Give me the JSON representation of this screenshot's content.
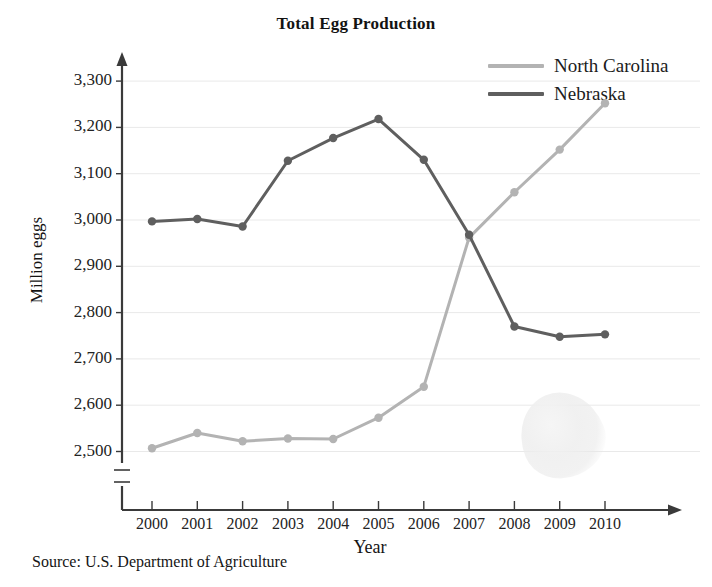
{
  "chart_data": {
    "type": "line",
    "title": "Total Egg Production",
    "xlabel": "Year",
    "ylabel": "Million eggs",
    "source": "Source: U.S. Department of Agriculture",
    "categories": [
      "2000",
      "2001",
      "2002",
      "2003",
      "2004",
      "2005",
      "2006",
      "2007",
      "2008",
      "2009",
      "2010"
    ],
    "ylim": [
      2500,
      3300
    ],
    "yticks": [
      "2,500",
      "2,600",
      "2,700",
      "2,800",
      "2,900",
      "3,000",
      "3,100",
      "3,200",
      "3,300"
    ],
    "ytick_values": [
      2500,
      2600,
      2700,
      2800,
      2900,
      3000,
      3100,
      3200,
      3300
    ],
    "grid": true,
    "axis_break": true,
    "legend_position": "top-right",
    "series": [
      {
        "name": "North Carolina",
        "color": "#b3b3b3",
        "values": [
          2507,
          2540,
          2522,
          2528,
          2527,
          2573,
          2640,
          2962,
          3060,
          3152,
          3252
        ]
      },
      {
        "name": "Nebraska",
        "color": "#5f5f5f",
        "values": [
          2997,
          3002,
          2986,
          3128,
          3177,
          3218,
          3130,
          2968,
          2770,
          2748,
          2753
        ]
      }
    ]
  },
  "legend": {
    "items": [
      {
        "label": "North Carolina",
        "color": "#b3b3b3"
      },
      {
        "label": "Nebraska",
        "color": "#5f5f5f"
      }
    ]
  }
}
